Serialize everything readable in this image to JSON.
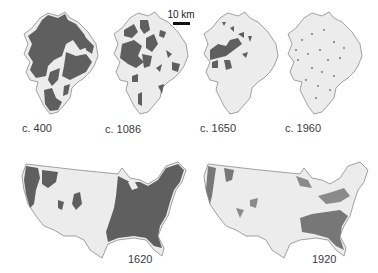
{
  "figure": {
    "scale_bar": {
      "label": "10 km"
    },
    "colors": {
      "forest": "#5f5f5f",
      "land": "#ececec",
      "outline": "#8a8a8a",
      "background": "#ffffff"
    },
    "region_maps": [
      {
        "label": "c. 400",
        "forest_cover": "high"
      },
      {
        "label": "c. 1086",
        "forest_cover": "medium"
      },
      {
        "label": "c. 1650",
        "forest_cover": "low"
      },
      {
        "label": "c. 1960",
        "forest_cover": "minimal"
      }
    ],
    "us_maps": [
      {
        "label": "1620",
        "forest_cover": "eastern and northwestern US heavily forested"
      },
      {
        "label": "1920",
        "forest_cover": "scattered remnants, mostly southeast and northwest"
      }
    ]
  }
}
